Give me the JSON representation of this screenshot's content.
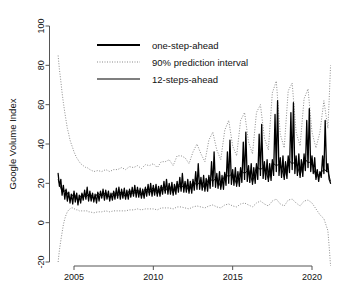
{
  "chart_data": {
    "type": "line",
    "title": "",
    "xlabel": "",
    "ylabel": "Google Volume Index",
    "xlim": [
      2003.7,
      2021.6
    ],
    "ylim": [
      -24,
      103
    ],
    "grid": false,
    "legend_position": "top-center",
    "xticks": [
      2005,
      2010,
      2015,
      2020
    ],
    "xtick_labels": [
      "2005",
      "2010",
      "2015",
      "2020"
    ],
    "yticks": [
      -20,
      0,
      20,
      40,
      60,
      80,
      100
    ],
    "ytick_labels": [
      "-20",
      "0",
      "20",
      "40",
      "60",
      "80",
      "100"
    ],
    "legend": [
      {
        "label": "one-step-ahead",
        "style": "solid-thick",
        "color": "#000000"
      },
      {
        "label": "90% prediction interval",
        "style": "dotted",
        "color": "#8a8a8a"
      },
      {
        "label": "12-steps-ahead",
        "style": "solid-thin",
        "color": "#000000"
      }
    ],
    "series": [
      {
        "name": "one-step-ahead",
        "style": "solid-thick",
        "x": [
          2004.0,
          2004.08,
          2004.17,
          2004.25,
          2004.33,
          2004.42,
          2004.5,
          2004.58,
          2004.67,
          2004.75,
          2004.83,
          2004.92,
          2005.0,
          2005.08,
          2005.17,
          2005.25,
          2005.33,
          2005.42,
          2005.5,
          2005.58,
          2005.67,
          2005.75,
          2005.83,
          2005.92,
          2006.0,
          2006.08,
          2006.17,
          2006.25,
          2006.33,
          2006.42,
          2006.5,
          2006.58,
          2006.67,
          2006.75,
          2006.83,
          2006.92,
          2007.0,
          2007.08,
          2007.17,
          2007.25,
          2007.33,
          2007.42,
          2007.5,
          2007.58,
          2007.67,
          2007.75,
          2007.83,
          2007.92,
          2008.0,
          2008.08,
          2008.17,
          2008.25,
          2008.33,
          2008.42,
          2008.5,
          2008.58,
          2008.67,
          2008.75,
          2008.83,
          2008.92,
          2009.0,
          2009.08,
          2009.17,
          2009.25,
          2009.33,
          2009.42,
          2009.5,
          2009.58,
          2009.67,
          2009.75,
          2009.83,
          2009.92,
          2010.0,
          2010.08,
          2010.17,
          2010.25,
          2010.33,
          2010.42,
          2010.5,
          2010.58,
          2010.67,
          2010.75,
          2010.83,
          2010.92,
          2011.0,
          2011.08,
          2011.17,
          2011.25,
          2011.33,
          2011.42,
          2011.5,
          2011.58,
          2011.67,
          2011.75,
          2011.83,
          2011.92,
          2012.0,
          2012.08,
          2012.17,
          2012.25,
          2012.33,
          2012.42,
          2012.5,
          2012.58,
          2012.67,
          2012.75,
          2012.83,
          2012.92,
          2013.0,
          2013.08,
          2013.17,
          2013.25,
          2013.33,
          2013.42,
          2013.5,
          2013.58,
          2013.67,
          2013.75,
          2013.83,
          2013.92,
          2014.0,
          2014.08,
          2014.17,
          2014.25,
          2014.33,
          2014.42,
          2014.5,
          2014.58,
          2014.67,
          2014.75,
          2014.83,
          2014.92,
          2015.0,
          2015.08,
          2015.17,
          2015.25,
          2015.33,
          2015.42,
          2015.5,
          2015.58,
          2015.67,
          2015.75,
          2015.83,
          2015.92,
          2016.0,
          2016.08,
          2016.17,
          2016.25,
          2016.33,
          2016.42,
          2016.5,
          2016.58,
          2016.67,
          2016.75,
          2016.83,
          2016.92,
          2017.0,
          2017.08,
          2017.17,
          2017.25,
          2017.33,
          2017.42,
          2017.5,
          2017.58,
          2017.67,
          2017.75,
          2017.83,
          2017.92,
          2018.0,
          2018.08,
          2018.17,
          2018.25,
          2018.33,
          2018.42,
          2018.5,
          2018.58,
          2018.67,
          2018.75,
          2018.83,
          2018.92,
          2019.0,
          2019.08,
          2019.17,
          2019.25,
          2019.33,
          2019.42,
          2019.5,
          2019.58,
          2019.67,
          2019.75,
          2019.83,
          2019.92,
          2020.0,
          2020.08,
          2020.17,
          2020.25,
          2020.33,
          2020.42,
          2020.5,
          2020.58,
          2020.67,
          2020.75,
          2020.83,
          2020.92,
          2021.0,
          2021.08,
          2021.17
        ],
        "y": [
          25.0,
          18.5,
          22.0,
          14.0,
          19.0,
          12.0,
          17.0,
          11.0,
          15.5,
          10.0,
          14.5,
          9.5,
          16.0,
          10.5,
          15.0,
          9.0,
          14.0,
          10.0,
          15.0,
          11.5,
          16.5,
          12.0,
          18.0,
          11.0,
          16.0,
          11.0,
          15.0,
          10.5,
          14.5,
          10.0,
          15.5,
          11.0,
          16.0,
          12.5,
          17.0,
          11.5,
          16.5,
          12.0,
          16.0,
          11.0,
          15.0,
          11.5,
          16.0,
          12.0,
          17.5,
          12.5,
          18.0,
          12.0,
          17.0,
          12.5,
          17.5,
          12.0,
          16.5,
          12.0,
          17.0,
          13.0,
          18.0,
          13.5,
          19.0,
          13.0,
          18.0,
          13.0,
          17.5,
          12.5,
          17.0,
          12.5,
          18.0,
          13.5,
          19.5,
          14.0,
          20.0,
          13.5,
          19.0,
          14.0,
          19.5,
          13.5,
          18.5,
          13.5,
          19.0,
          14.5,
          21.0,
          15.0,
          22.0,
          14.5,
          20.0,
          14.5,
          20.5,
          14.0,
          19.5,
          14.5,
          21.0,
          15.5,
          23.0,
          16.0,
          25.0,
          15.5,
          21.0,
          15.5,
          22.0,
          15.0,
          21.0,
          15.0,
          22.0,
          16.5,
          26.0,
          17.0,
          30.0,
          17.0,
          23.0,
          16.5,
          24.0,
          16.0,
          22.5,
          16.0,
          24.0,
          17.5,
          31.0,
          18.5,
          36.0,
          18.0,
          25.0,
          17.5,
          26.0,
          17.0,
          24.0,
          17.0,
          25.5,
          19.0,
          36.0,
          20.0,
          42.0,
          19.5,
          27.0,
          19.0,
          28.0,
          18.5,
          26.0,
          18.5,
          28.0,
          20.5,
          41.0,
          22.0,
          46.0,
          21.0,
          29.0,
          20.5,
          30.0,
          19.5,
          28.0,
          20.0,
          30.0,
          22.0,
          45.0,
          24.0,
          50.0,
          22.5,
          31.0,
          22.0,
          32.0,
          21.0,
          30.0,
          21.5,
          32.0,
          24.0,
          55.0,
          26.0,
          62.0,
          24.0,
          33.0,
          23.0,
          34.0,
          22.0,
          31.0,
          22.5,
          34.0,
          25.5,
          56.0,
          27.0,
          61.0,
          25.0,
          34.0,
          24.0,
          35.0,
          23.0,
          32.0,
          23.5,
          35.0,
          26.5,
          52.0,
          28.0,
          58.0,
          26.0,
          34.0,
          25.0,
          33.0,
          22.0,
          27.0,
          21.0,
          26.0,
          23.0,
          34.0,
          25.0,
          52.0,
          26.0,
          30.0,
          22.0,
          20.0
        ]
      },
      {
        "name": "12-steps-ahead",
        "style": "solid-thin",
        "x": [
          2004.0,
          2004.25,
          2004.5,
          2004.75,
          2005.0,
          2005.25,
          2005.5,
          2005.75,
          2006.0,
          2006.25,
          2006.5,
          2006.75,
          2007.0,
          2007.25,
          2007.5,
          2007.75,
          2008.0,
          2008.25,
          2008.5,
          2008.75,
          2009.0,
          2009.25,
          2009.5,
          2009.75,
          2010.0,
          2010.25,
          2010.5,
          2010.75,
          2011.0,
          2011.25,
          2011.5,
          2011.75,
          2012.0,
          2012.25,
          2012.5,
          2012.75,
          2013.0,
          2013.25,
          2013.5,
          2013.75,
          2014.0,
          2014.25,
          2014.5,
          2014.75,
          2015.0,
          2015.25,
          2015.5,
          2015.75,
          2016.0,
          2016.25,
          2016.5,
          2016.75,
          2017.0,
          2017.25,
          2017.5,
          2017.75,
          2018.0,
          2018.25,
          2018.5,
          2018.75,
          2019.0,
          2019.25,
          2019.5,
          2019.75,
          2020.0,
          2020.25,
          2020.5,
          2020.75,
          2021.0,
          2021.17
        ],
        "y": [
          22.0,
          15.5,
          16.5,
          12.0,
          15.0,
          11.0,
          14.5,
          13.0,
          15.0,
          12.0,
          15.0,
          13.5,
          15.5,
          12.5,
          15.5,
          13.5,
          16.0,
          13.0,
          16.5,
          14.5,
          17.0,
          13.5,
          17.5,
          15.0,
          18.0,
          14.5,
          18.5,
          16.0,
          19.0,
          15.0,
          20.0,
          17.5,
          20.0,
          16.0,
          21.0,
          19.0,
          21.5,
          17.0,
          23.0,
          21.0,
          23.0,
          18.0,
          24.5,
          23.5,
          25.0,
          19.5,
          26.5,
          25.0,
          27.0,
          20.5,
          28.5,
          27.0,
          28.5,
          22.0,
          30.5,
          29.0,
          30.0,
          23.0,
          32.0,
          30.0,
          31.0,
          24.0,
          33.0,
          30.5,
          31.0,
          23.0,
          25.0,
          27.0,
          26.0,
          21.0
        ]
      }
    ],
    "band": {
      "name": "90% prediction interval",
      "style": "dotted",
      "x": [
        2004.0,
        2004.08,
        2004.17,
        2004.25,
        2004.33,
        2004.42,
        2004.5,
        2004.58,
        2004.67,
        2004.75,
        2004.83,
        2004.92,
        2005.0,
        2005.08,
        2005.17,
        2005.25,
        2005.33,
        2005.42,
        2005.5,
        2005.58,
        2005.67,
        2005.75,
        2005.83,
        2005.92,
        2006.0,
        2006.25,
        2006.5,
        2006.75,
        2007.0,
        2007.25,
        2007.5,
        2007.75,
        2008.0,
        2008.25,
        2008.5,
        2008.75,
        2009.0,
        2009.25,
        2009.5,
        2009.75,
        2010.0,
        2010.25,
        2010.5,
        2010.75,
        2011.0,
        2011.25,
        2011.5,
        2011.75,
        2012.0,
        2012.25,
        2012.5,
        2012.75,
        2013.0,
        2013.25,
        2013.5,
        2013.75,
        2014.0,
        2014.25,
        2014.5,
        2014.75,
        2015.0,
        2015.25,
        2015.5,
        2015.75,
        2016.0,
        2016.25,
        2016.5,
        2016.75,
        2017.0,
        2017.25,
        2017.5,
        2017.75,
        2018.0,
        2018.25,
        2018.5,
        2018.75,
        2019.0,
        2019.25,
        2019.5,
        2019.75,
        2020.0,
        2020.25,
        2020.5,
        2020.75,
        2021.0,
        2021.08,
        2021.17
      ],
      "upper": [
        85.0,
        78.0,
        72.0,
        66.0,
        61.0,
        56.0,
        52.0,
        48.0,
        45.0,
        42.0,
        40.0,
        38.0,
        36.0,
        34.5,
        33.0,
        32.0,
        31.0,
        30.0,
        29.5,
        29.0,
        28.5,
        28.0,
        28.0,
        27.5,
        27.0,
        26.0,
        26.5,
        26.0,
        27.0,
        26.0,
        27.0,
        27.0,
        28.0,
        27.0,
        28.5,
        28.0,
        29.0,
        27.5,
        29.5,
        29.0,
        30.0,
        28.0,
        31.0,
        31.0,
        32.0,
        29.0,
        34.0,
        34.0,
        33.0,
        30.0,
        36.0,
        40.0,
        35.0,
        31.0,
        42.0,
        46.0,
        37.0,
        32.0,
        47.0,
        52.0,
        39.0,
        34.0,
        52.0,
        56.0,
        41.0,
        35.0,
        56.0,
        60.0,
        43.0,
        37.0,
        66.0,
        72.0,
        45.0,
        38.0,
        67.0,
        71.0,
        46.0,
        39.0,
        63.0,
        68.0,
        46.0,
        38.0,
        46.0,
        62.0,
        48.0,
        62.0,
        80.0
      ],
      "lower": [
        -20.0,
        -14.0,
        -9.0,
        -5.0,
        -1.0,
        2.0,
        4.0,
        5.5,
        6.5,
        7.0,
        7.5,
        7.5,
        7.0,
        7.0,
        6.5,
        6.5,
        6.0,
        6.0,
        6.0,
        6.0,
        6.0,
        6.0,
        6.0,
        5.5,
        5.5,
        5.0,
        5.5,
        5.5,
        6.0,
        5.5,
        6.0,
        6.0,
        6.0,
        6.0,
        6.5,
        6.5,
        7.0,
        6.5,
        7.0,
        7.0,
        7.0,
        6.5,
        7.5,
        7.5,
        7.5,
        7.0,
        8.0,
        8.0,
        7.5,
        7.0,
        8.0,
        8.5,
        8.0,
        7.5,
        8.5,
        9.0,
        8.0,
        7.5,
        9.0,
        9.5,
        8.5,
        8.0,
        9.5,
        10.0,
        9.0,
        8.0,
        10.0,
        11.0,
        9.5,
        8.5,
        11.0,
        12.0,
        9.5,
        8.5,
        11.5,
        12.0,
        10.0,
        8.5,
        11.0,
        11.5,
        10.0,
        7.0,
        4.0,
        2.0,
        -4.0,
        -12.0,
        -22.0
      ]
    }
  }
}
